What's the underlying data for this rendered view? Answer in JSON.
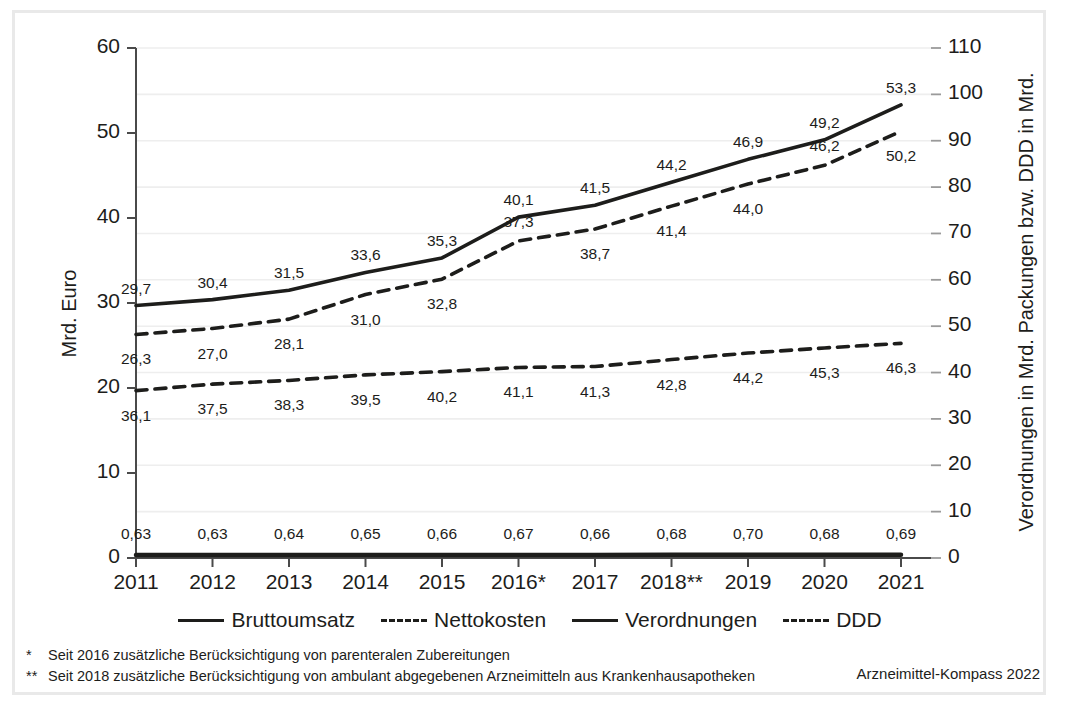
{
  "chart_data": {
    "type": "line",
    "title": "",
    "xlabel": "",
    "ylabel": "Mrd. Euro",
    "y2label": "Verordnungen in Mrd. Packungen bzw. DDD in Mrd.",
    "categories": [
      "2011",
      "2012",
      "2013",
      "2014",
      "2015",
      "2016*",
      "2017",
      "2018**",
      "2019",
      "2020",
      "2021"
    ],
    "ylim": [
      0,
      60
    ],
    "y2lim": [
      0,
      110
    ],
    "yticks": [
      "0",
      "10",
      "20",
      "30",
      "40",
      "50",
      "60"
    ],
    "y2ticks": [
      "0",
      "10",
      "20",
      "30",
      "40",
      "50",
      "60",
      "70",
      "80",
      "90",
      "100",
      "110"
    ],
    "grid": true,
    "legend_position": "bottom",
    "series": [
      {
        "name": "Bruttoumsatz",
        "axis": "left",
        "style": "solid",
        "values": [
          29.7,
          30.4,
          31.5,
          33.6,
          35.3,
          40.1,
          41.5,
          44.2,
          46.9,
          49.2,
          53.3
        ],
        "labels": [
          "29,7",
          "30,4",
          "31,5",
          "33,6",
          "35,3",
          "40,1",
          "41,5",
          "44,2",
          "46,9",
          "49,2",
          "53,3"
        ]
      },
      {
        "name": "Nettokosten",
        "axis": "left",
        "style": "dashed",
        "values": [
          26.3,
          27.0,
          28.1,
          31.0,
          32.8,
          37.3,
          38.7,
          41.4,
          44.0,
          46.2,
          50.2
        ],
        "labels": [
          "26,3",
          "27,0",
          "28,1",
          "31,0",
          "32,8",
          "37,3",
          "38,7",
          "41,4",
          "44,0",
          "46,2",
          "50,2"
        ]
      },
      {
        "name": "Verordnungen",
        "axis": "right",
        "style": "solid",
        "values": [
          0.63,
          0.63,
          0.64,
          0.65,
          0.66,
          0.67,
          0.66,
          0.68,
          0.7,
          0.68,
          0.69
        ],
        "labels": [
          "0,63",
          "0,63",
          "0,64",
          "0,65",
          "0,66",
          "0,67",
          "0,66",
          "0,68",
          "0,70",
          "0,68",
          "0,69"
        ]
      },
      {
        "name": "DDD",
        "axis": "right",
        "style": "dashed",
        "values": [
          36.1,
          37.5,
          38.3,
          39.5,
          40.2,
          41.1,
          41.3,
          42.8,
          44.2,
          45.3,
          46.3
        ],
        "labels": [
          "36,1",
          "37,5",
          "38,3",
          "39,5",
          "40,2",
          "41,1",
          "41,3",
          "42,8",
          "44,2",
          "45,3",
          "46,3"
        ]
      }
    ],
    "colors": {
      "line": "#1d1d1b",
      "grid": "#eeeeee",
      "axis": "#4a4a4a",
      "frame": "#e9e9e9"
    }
  },
  "legend": {
    "items": [
      {
        "label": "Bruttoumsatz",
        "style": "solid"
      },
      {
        "label": "Nettokosten",
        "style": "dashed"
      },
      {
        "label": "Verordnungen",
        "style": "solid"
      },
      {
        "label": "DDD",
        "style": "dashed"
      }
    ]
  },
  "footnotes": [
    {
      "mark": "*",
      "text": "Seit 2016 zusätzliche Berücksichtigung von parenteralen Zubereitungen"
    },
    {
      "mark": "**",
      "text": "Seit 2018 zusätzliche Berücksichtigung von ambulant abgegebenen Arzneimitteln aus Krankenhausapotheken"
    }
  ],
  "source": "Arzneimittel-Kompass 2022"
}
